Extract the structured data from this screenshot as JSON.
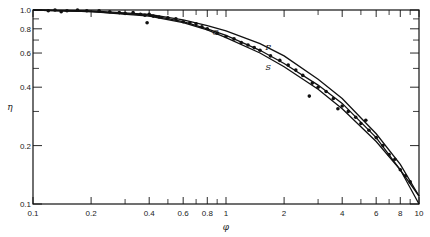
{
  "chart_data": {
    "type": "scatter",
    "title": "",
    "xlabel": "φ",
    "ylabel": "η",
    "xscale": "log",
    "yscale": "log",
    "xlim": [
      0.1,
      10
    ],
    "ylim": [
      0.1,
      1.0
    ],
    "x_ticks": [
      0.1,
      0.2,
      0.4,
      0.6,
      0.8,
      1,
      2,
      4,
      6,
      8,
      10
    ],
    "x_tick_labels": [
      "0.1",
      "0.2",
      "0.4",
      "0.6",
      "0.8",
      "1",
      "2",
      "4",
      "6",
      "8",
      "10"
    ],
    "y_ticks": [
      0.1,
      0.2,
      0.4,
      0.6,
      0.8,
      1.0
    ],
    "y_tick_labels": [
      "0.1",
      "0.2",
      "0.4",
      "0.6",
      "0.8",
      "1.0"
    ],
    "grid": false,
    "legend": "none",
    "annotations": [
      {
        "text": "C",
        "x": 0.85,
        "y": 0.74
      },
      {
        "text": "P",
        "x": 1.6,
        "y": 0.62
      },
      {
        "text": "S",
        "x": 1.6,
        "y": 0.49
      }
    ],
    "series": [
      {
        "name": "P",
        "kind": "line",
        "x": [
          0.1,
          0.2,
          0.4,
          0.6,
          0.8,
          1,
          1.5,
          2,
          3,
          4,
          6,
          8,
          10
        ],
        "y": [
          1.0,
          0.99,
          0.95,
          0.89,
          0.83,
          0.78,
          0.67,
          0.58,
          0.44,
          0.35,
          0.23,
          0.16,
          0.11
        ]
      },
      {
        "name": "C",
        "kind": "line",
        "x": [
          0.1,
          0.2,
          0.4,
          0.6,
          0.8,
          1,
          1.5,
          2,
          3,
          4,
          6,
          8,
          10
        ],
        "y": [
          1.0,
          0.98,
          0.94,
          0.87,
          0.8,
          0.74,
          0.62,
          0.53,
          0.41,
          0.33,
          0.22,
          0.15,
          0.11
        ]
      },
      {
        "name": "S",
        "kind": "line",
        "x": [
          0.1,
          0.2,
          0.4,
          0.6,
          0.8,
          1,
          1.5,
          2,
          3,
          4,
          6,
          8,
          10
        ],
        "y": [
          1.0,
          0.98,
          0.93,
          0.86,
          0.79,
          0.72,
          0.6,
          0.51,
          0.39,
          0.31,
          0.21,
          0.15,
          0.1
        ]
      },
      {
        "name": "data",
        "kind": "scatter",
        "x": [
          0.12,
          0.13,
          0.14,
          0.15,
          0.17,
          0.19,
          0.22,
          0.25,
          0.28,
          0.3,
          0.33,
          0.36,
          0.38,
          0.4,
          0.42,
          0.45,
          0.5,
          0.55,
          0.6,
          0.65,
          0.7,
          0.75,
          0.8,
          0.9,
          1.0,
          1.1,
          1.2,
          1.3,
          1.4,
          1.5,
          1.7,
          1.9,
          2.1,
          2.3,
          2.5,
          2.8,
          3.0,
          3.3,
          3.6,
          4.0,
          4.3,
          4.7,
          5.0,
          5.5,
          6.0,
          6.5,
          7.0,
          7.5,
          8.0,
          8.5,
          9.0,
          0.39,
          2.7,
          3.8,
          5.3
        ],
        "y": [
          0.99,
          1.0,
          0.98,
          0.99,
          1.0,
          0.99,
          0.99,
          0.98,
          0.97,
          0.96,
          0.97,
          0.95,
          0.94,
          0.95,
          0.93,
          0.92,
          0.91,
          0.9,
          0.87,
          0.86,
          0.85,
          0.82,
          0.8,
          0.76,
          0.73,
          0.71,
          0.68,
          0.66,
          0.64,
          0.62,
          0.58,
          0.55,
          0.52,
          0.49,
          0.46,
          0.42,
          0.4,
          0.38,
          0.35,
          0.32,
          0.3,
          0.28,
          0.26,
          0.24,
          0.22,
          0.2,
          0.18,
          0.17,
          0.15,
          0.14,
          0.13,
          0.86,
          0.36,
          0.31,
          0.27
        ]
      }
    ]
  }
}
